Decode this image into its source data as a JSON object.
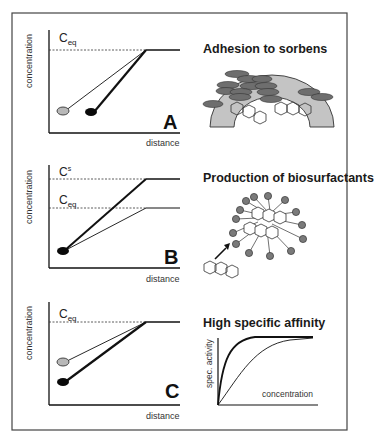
{
  "figure": {
    "frame": {
      "stroke": "#444444"
    },
    "panels": [
      {
        "id": "A",
        "letter": "A",
        "ylabel": "concentration",
        "xlabel": "distance",
        "levels": [
          {
            "label_main": "C",
            "label_sub": "eq",
            "label_sup": "",
            "type": "ceq"
          }
        ],
        "mechanism_title": "Adhesion to sorbens"
      },
      {
        "id": "B",
        "letter": "B",
        "ylabel": "concentration",
        "xlabel": "distance",
        "levels": [
          {
            "label_main": "C",
            "label_sub": "",
            "label_sup": "s",
            "type": "cs"
          },
          {
            "label_main": "C",
            "label_sub": "eq",
            "label_sup": "",
            "type": "ceq"
          }
        ],
        "mechanism_title": "Production of biosurfactants"
      },
      {
        "id": "C",
        "letter": "C",
        "ylabel": "concentration",
        "xlabel": "distance",
        "levels": [
          {
            "label_main": "C",
            "label_sub": "eq",
            "label_sup": "",
            "type": "ceq"
          }
        ],
        "mechanism_title": "High specific affinity",
        "inset": {
          "ylabel": "spec. activity",
          "xlabel": "concentration"
        }
      }
    ],
    "colors": {
      "line": "#111111",
      "gray_cell": "#b8b8b8",
      "black_cell": "#0a0a0a",
      "sorbent": "#c4c4c4",
      "bacteria": "#6e6e6e",
      "micelle_head": "#7a7a7a"
    }
  }
}
